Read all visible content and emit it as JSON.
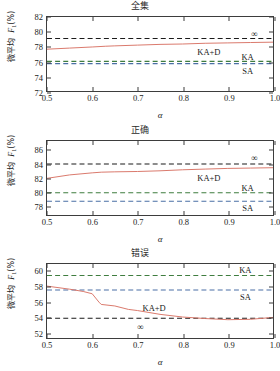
{
  "figure": {
    "xlabel": "α",
    "ylabel_prefix": "微平均",
    "ylabel_metric": "F",
    "ylabel_sub": "1",
    "ylabel_unit": "(%)",
    "colors": {
      "curve": "#d9776a",
      "baseline_inf": "#1a1a1a",
      "baseline_ka": "#3f7d3f",
      "baseline_sa": "#4a6fa5",
      "axis": "#3d3d3d"
    }
  },
  "chart_data": [
    {
      "type": "line",
      "title": "全集",
      "xlabel": "α",
      "ylabel": "微平均 F1(%)",
      "xlim": [
        0.5,
        1.0
      ],
      "ylim": [
        72,
        82
      ],
      "xticks": [
        "0.5",
        "0.6",
        "0.7",
        "0.8",
        "0.9",
        "1.0"
      ],
      "yticks": [
        "72",
        "74",
        "76",
        "78",
        "80",
        "82"
      ],
      "grid": false,
      "legend_position": "inline-annotations",
      "series": [
        {
          "name": "KA+D",
          "style": "solid",
          "color": "#d9776a",
          "x": [
            0.5,
            0.55,
            0.6,
            0.63,
            0.65,
            0.7,
            0.75,
            0.8,
            0.85,
            0.9,
            0.95,
            1.0
          ],
          "values": [
            77.65,
            77.8,
            77.95,
            78.05,
            78.1,
            78.2,
            78.3,
            78.35,
            78.45,
            78.5,
            78.55,
            78.6
          ]
        }
      ],
      "baselines": [
        {
          "name": "∞",
          "value": 79.1,
          "style": "dashed",
          "color": "#1a1a1a"
        },
        {
          "name": "KA",
          "value": 76.0,
          "style": "dashed",
          "color": "#3f7d3f"
        },
        {
          "name": "SA",
          "value": 75.7,
          "style": "dashed",
          "color": "#4a6fa5"
        }
      ],
      "annotations": [
        {
          "text": "KA+D",
          "x": 0.855,
          "y": 77.35
        },
        {
          "text": "KA",
          "x": 0.94,
          "y": 76.75
        },
        {
          "text": "SA",
          "x": 0.94,
          "y": 74.95
        },
        {
          "text": "∞",
          "x": 0.955,
          "y": 79.7
        }
      ]
    },
    {
      "type": "line",
      "title": "正确",
      "xlabel": "α",
      "ylabel": "微平均 F1(%)",
      "xlim": [
        0.5,
        1.0
      ],
      "ylim": [
        76.6,
        87.4
      ],
      "xticks": [
        "0.5",
        "0.6",
        "0.7",
        "0.8",
        "0.9",
        "1.0"
      ],
      "yticks": [
        "78",
        "80",
        "82",
        "84",
        "86"
      ],
      "grid": false,
      "legend_position": "inline-annotations",
      "series": [
        {
          "name": "KA+D",
          "style": "solid",
          "color": "#d9776a",
          "x": [
            0.5,
            0.55,
            0.6,
            0.62,
            0.65,
            0.7,
            0.75,
            0.8,
            0.85,
            0.9,
            0.95,
            1.0
          ],
          "values": [
            81.95,
            82.45,
            82.75,
            82.85,
            82.9,
            82.95,
            83.05,
            83.2,
            83.3,
            83.4,
            83.45,
            83.5
          ]
        }
      ],
      "baselines": [
        {
          "name": "∞",
          "value": 84.05,
          "style": "dashed",
          "color": "#1a1a1a"
        },
        {
          "name": "KA",
          "value": 79.85,
          "style": "dashed",
          "color": "#3f7d3f"
        },
        {
          "name": "SA",
          "value": 78.6,
          "style": "dashed",
          "color": "#4a6fa5"
        }
      ],
      "annotations": [
        {
          "text": "KA+D",
          "x": 0.855,
          "y": 82.15
        },
        {
          "text": "KA",
          "x": 0.94,
          "y": 80.6
        },
        {
          "text": "SA",
          "x": 0.94,
          "y": 77.8
        },
        {
          "text": "∞",
          "x": 0.955,
          "y": 84.9
        }
      ]
    },
    {
      "type": "line",
      "title": "错误",
      "xlabel": "α",
      "ylabel": "微平均 F1(%)",
      "xlim": [
        0.5,
        1.0
      ],
      "ylim": [
        51.2,
        60.9
      ],
      "xticks": [
        "0.5",
        "0.6",
        "0.7",
        "0.8",
        "0.9",
        "1.0"
      ],
      "yticks": [
        "52",
        "54",
        "56",
        "58",
        "60"
      ],
      "grid": false,
      "legend_position": "inline-annotations",
      "series": [
        {
          "name": "KA+D",
          "style": "solid",
          "color": "#d9776a",
          "x": [
            0.5,
            0.55,
            0.58,
            0.6,
            0.615,
            0.62,
            0.65,
            0.68,
            0.7,
            0.75,
            0.8,
            0.85,
            0.9,
            0.95,
            1.0
          ],
          "values": [
            58.0,
            57.6,
            57.3,
            57.0,
            55.9,
            55.6,
            55.4,
            54.95,
            54.8,
            54.3,
            53.95,
            53.75,
            53.6,
            53.65,
            53.9
          ]
        }
      ],
      "baselines": [
        {
          "name": "KA",
          "value": 59.4,
          "style": "dashed",
          "color": "#3f7d3f"
        },
        {
          "name": "SA",
          "value": 57.5,
          "style": "dashed",
          "color": "#4a6fa5"
        },
        {
          "name": "∞",
          "value": 53.8,
          "style": "dashed",
          "color": "#1a1a1a"
        }
      ],
      "annotations": [
        {
          "text": "KA",
          "x": 0.935,
          "y": 60.15
        },
        {
          "text": "SA",
          "x": 0.935,
          "y": 56.65
        },
        {
          "text": "KA+D",
          "x": 0.735,
          "y": 55.3
        },
        {
          "text": "∞",
          "x": 0.705,
          "y": 52.9
        }
      ]
    }
  ]
}
